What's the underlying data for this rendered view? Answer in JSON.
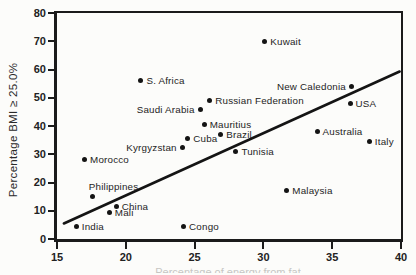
{
  "chart_data": {
    "type": "scatter",
    "title": "",
    "ylabel": "Percentage BMI ≥ 25.0%",
    "xlabel": "",
    "xlabel_cropped": "Percentage of energy from fat",
    "xlim": [
      15,
      40
    ],
    "ylim": [
      0,
      80
    ],
    "x_ticks": [
      15,
      20,
      25,
      30,
      35,
      40
    ],
    "y_ticks": [
      0,
      10,
      20,
      30,
      40,
      50,
      60,
      70,
      80
    ],
    "grid": false,
    "legend": "none",
    "marker": "filled-circle",
    "points": [
      {
        "name": "India",
        "x": 16.4,
        "y": 4.5,
        "label_side": "right"
      },
      {
        "name": "Morocco",
        "x": 17.0,
        "y": 28,
        "label_side": "right"
      },
      {
        "name": "Philippines",
        "x": 17.6,
        "y": 15,
        "label_side": "above"
      },
      {
        "name": "Mali",
        "x": 18.8,
        "y": 9.5,
        "label_side": "right"
      },
      {
        "name": "China",
        "x": 19.3,
        "y": 11.5,
        "label_side": "right"
      },
      {
        "name": "S. Africa",
        "x": 21.1,
        "y": 56,
        "label_side": "right"
      },
      {
        "name": "Kyrgyzstan",
        "x": 24.1,
        "y": 32.5,
        "label_side": "left"
      },
      {
        "name": "Congo",
        "x": 24.2,
        "y": 4.5,
        "label_side": "right"
      },
      {
        "name": "Cuba",
        "x": 24.5,
        "y": 35.5,
        "label_side": "right"
      },
      {
        "name": "Saudi Arabia",
        "x": 25.4,
        "y": 46,
        "label_side": "left"
      },
      {
        "name": "Mauritius",
        "x": 25.7,
        "y": 40.5,
        "label_side": "right"
      },
      {
        "name": "Russian Federation",
        "x": 26.1,
        "y": 49,
        "label_side": "right"
      },
      {
        "name": "Brazil",
        "x": 26.9,
        "y": 37,
        "label_side": "right"
      },
      {
        "name": "Tunisia",
        "x": 28.0,
        "y": 31,
        "label_side": "right"
      },
      {
        "name": "Kuwait",
        "x": 30.1,
        "y": 70,
        "label_side": "right"
      },
      {
        "name": "Malaysia",
        "x": 31.7,
        "y": 17,
        "label_side": "right"
      },
      {
        "name": "Australia",
        "x": 33.9,
        "y": 38,
        "label_side": "right"
      },
      {
        "name": "New Caledonia",
        "x": 36.4,
        "y": 54,
        "label_side": "left"
      },
      {
        "name": "USA",
        "x": 36.3,
        "y": 48,
        "label_side": "right"
      },
      {
        "name": "Italy",
        "x": 37.7,
        "y": 34.5,
        "label_side": "right"
      }
    ],
    "trend_line": {
      "x1": 15.5,
      "y1": 5.5,
      "x2": 39.9,
      "y2": 59.3
    }
  },
  "colors": {
    "ink": "#1b1b1b",
    "paper": "#fcfcfa"
  }
}
